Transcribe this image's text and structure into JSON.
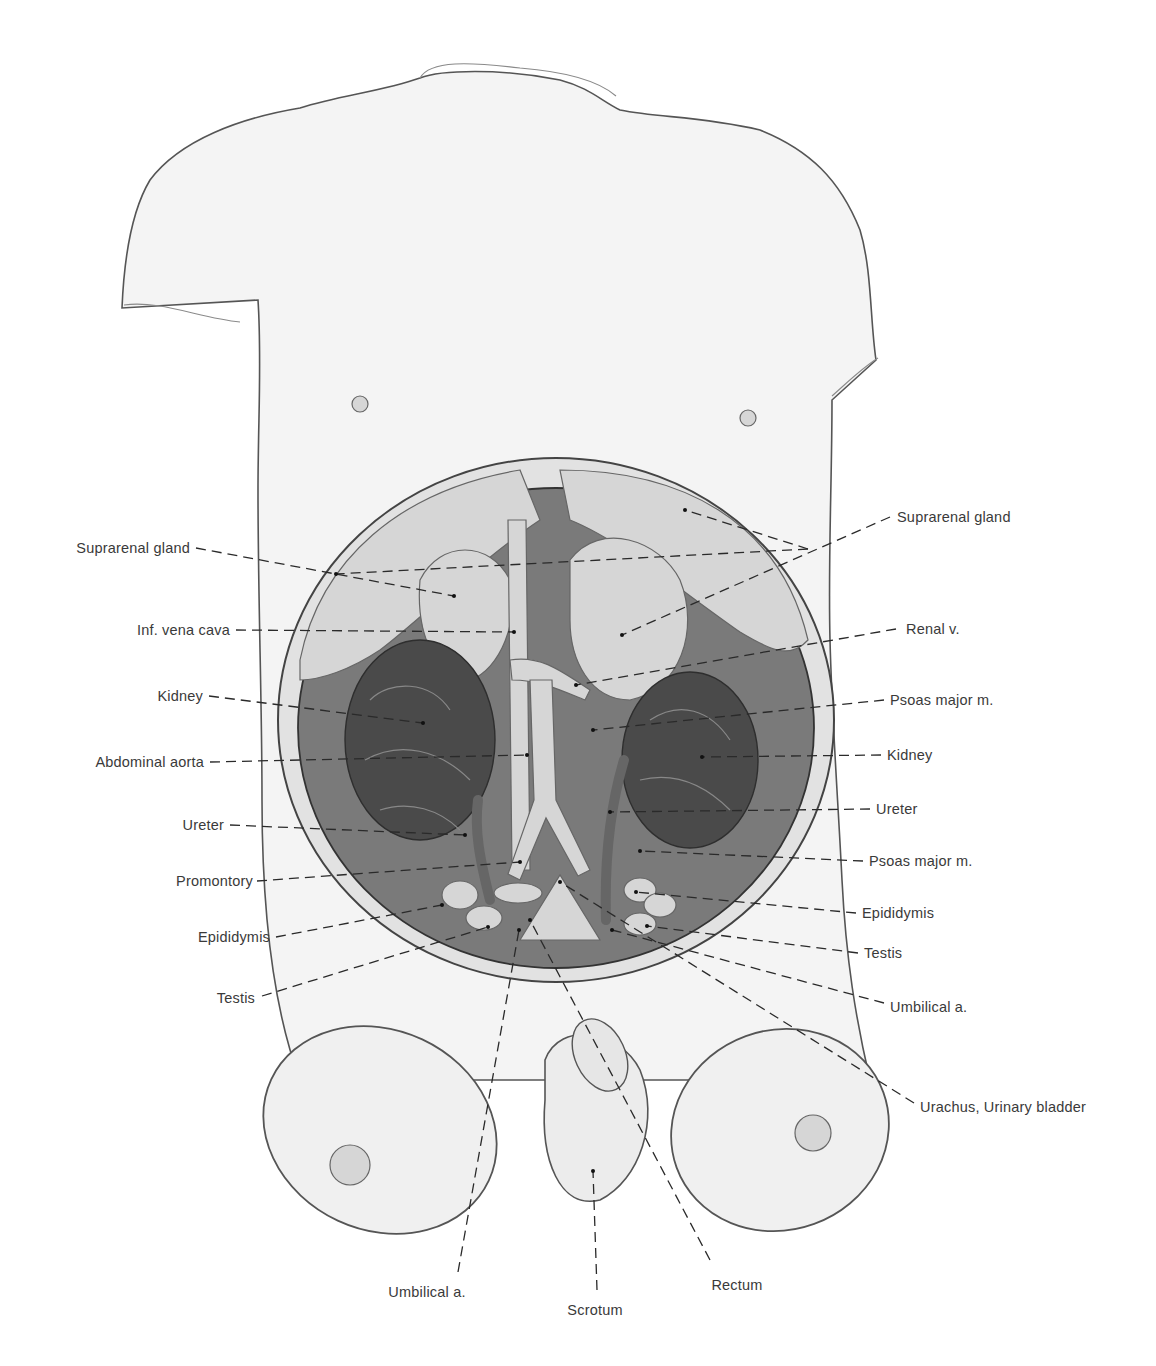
{
  "figure": {
    "colors": {
      "background": "#ffffff",
      "label_text": "#3a3a3a",
      "leader_line": "#2a2a2a",
      "sketch": "#555555"
    }
  },
  "labels_left": [
    {
      "text": "Suprarenal gland",
      "x": 190,
      "y": 540
    },
    {
      "text": "Inf. vena cava",
      "x": 230,
      "y": 622
    },
    {
      "text": "Kidney",
      "x": 203,
      "y": 688
    },
    {
      "text": "Abdominal aorta",
      "x": 204,
      "y": 754
    },
    {
      "text": "Ureter",
      "x": 224,
      "y": 817
    },
    {
      "text": "Promontory",
      "x": 253,
      "y": 873
    },
    {
      "text": "Epididymis",
      "x": 270,
      "y": 929
    },
    {
      "text": "Testis",
      "x": 255,
      "y": 990
    }
  ],
  "labels_right": [
    {
      "text": "Suprarenal gland",
      "x": 897,
      "y": 509
    },
    {
      "text": "Renal v.",
      "x": 906,
      "y": 621
    },
    {
      "text": "Psoas major m.",
      "x": 890,
      "y": 692
    },
    {
      "text": "Kidney",
      "x": 887,
      "y": 747
    },
    {
      "text": "Ureter",
      "x": 876,
      "y": 801
    },
    {
      "text": "Psoas major m.",
      "x": 869,
      "y": 853
    },
    {
      "text": "Epididymis",
      "x": 862,
      "y": 905
    },
    {
      "text": "Testis",
      "x": 864,
      "y": 945
    },
    {
      "text": "Umbilical a.",
      "x": 890,
      "y": 999
    },
    {
      "text": "Urachus, Urinary bladder",
      "x": 920,
      "y": 1099
    }
  ],
  "labels_bottom": [
    {
      "text": "Umbilical a.",
      "x": 427,
      "y": 1284
    },
    {
      "text": "Scrotum",
      "x": 595,
      "y": 1302
    },
    {
      "text": "Rectum",
      "x": 737,
      "y": 1277
    }
  ],
  "leaders": [
    {
      "from": [
        196,
        548
      ],
      "to": [
        454,
        596
      ]
    },
    {
      "from": [
        236,
        630
      ],
      "to": [
        514,
        632
      ]
    },
    {
      "from": [
        209,
        696
      ],
      "to": [
        423,
        723
      ]
    },
    {
      "from": [
        210,
        762
      ],
      "to": [
        527,
        755
      ]
    },
    {
      "from": [
        230,
        825
      ],
      "to": [
        465,
        835
      ]
    },
    {
      "from": [
        257,
        881
      ],
      "to": [
        520,
        862
      ]
    },
    {
      "from": [
        276,
        937
      ],
      "to": [
        442,
        905
      ]
    },
    {
      "from": [
        262,
        996
      ],
      "to": [
        488,
        927
      ]
    },
    {
      "from": [
        890,
        517
      ],
      "to": [
        622,
        635
      ]
    },
    {
      "from": [
        808,
        549
      ],
      "to": [
        685,
        510
      ]
    },
    {
      "from": [
        808,
        549
      ],
      "to": [
        336,
        574
      ]
    },
    {
      "from": [
        896,
        629
      ],
      "to": [
        576,
        685
      ]
    },
    {
      "from": [
        884,
        700
      ],
      "to": [
        593,
        730
      ]
    },
    {
      "from": [
        881,
        755
      ],
      "to": [
        702,
        757
      ]
    },
    {
      "from": [
        870,
        809
      ],
      "to": [
        610,
        812
      ]
    },
    {
      "from": [
        863,
        861
      ],
      "to": [
        640,
        851
      ]
    },
    {
      "from": [
        856,
        913
      ],
      "to": [
        636,
        892
      ]
    },
    {
      "from": [
        858,
        953
      ],
      "to": [
        647,
        926
      ]
    },
    {
      "from": [
        884,
        1003
      ],
      "to": [
        612,
        930
      ]
    },
    {
      "from": [
        914,
        1103
      ],
      "to": [
        560,
        882
      ]
    },
    {
      "from": [
        458,
        1272
      ],
      "to": [
        519,
        930
      ]
    },
    {
      "from": [
        597,
        1290
      ],
      "to": [
        593,
        1171
      ]
    },
    {
      "from": [
        710,
        1260
      ],
      "to": [
        530,
        920
      ]
    }
  ]
}
